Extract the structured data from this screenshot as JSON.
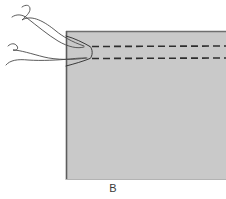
{
  "figure": {
    "label": "B",
    "colors": {
      "background": "#ffffff",
      "block_fill": "#c9c9c9",
      "block_edge": "#6e6e6e",
      "fiber_stroke": "#4a4a4a",
      "dashed_stroke": "#2e2e2e",
      "caption_color": "#3a3a3a"
    },
    "block": {
      "name": "gray-block",
      "x": 66,
      "y": 31,
      "width": 160,
      "height": 149
    },
    "dashed_lines": [
      {
        "name": "upper-dashed-line",
        "y": 46,
        "x_start": 90,
        "x_end": 226
      },
      {
        "name": "lower-dashed-line",
        "y": 58,
        "x_start": 90,
        "x_end": 226
      }
    ],
    "convergence_point": {
      "x": 90,
      "y": 52
    },
    "fibers": [
      {
        "name": "fiber-1",
        "path": "M 22 7 C 26 4 30 5 30 9 C 30 13 26 16 22 20 C 32 14 45 22 56 31 C 62 36 72 42 84 46"
      },
      {
        "name": "fiber-2",
        "path": "M 12 17 C 16 14 22 14 27 18 C 36 25 48 35 58 41 C 68 47 78 49 84 47"
      },
      {
        "name": "fiber-3",
        "path": "M 8 46 C 11 43 15 43 17 46 C 19 49 16 51 13 50 C 20 50 32 54 44 57 C 56 60 74 60 86 58"
      },
      {
        "name": "fiber-4",
        "path": "M 6 65 C 10 60 18 59 28 60 C 42 61 58 60 70 59 C 78 58 83 58 87 58"
      }
    ]
  }
}
